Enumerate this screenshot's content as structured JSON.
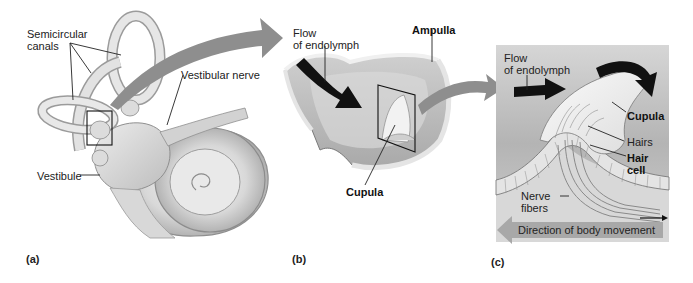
{
  "figure": {
    "panels": [
      {
        "id": "a",
        "letter": "(a)",
        "labels": {
          "semicircular_canals": "Semicircular canals",
          "semicircular_line1": "Semicircular",
          "semicircular_line2": "canals",
          "vestibular_nerve": "Vestibular nerve",
          "vestibule": "Vestibule"
        }
      },
      {
        "id": "b",
        "letter": "(b)",
        "labels": {
          "flow_line1": "Flow",
          "flow_line2": "of endolymph",
          "ampulla": "Ampulla",
          "cupula": "Cupula"
        }
      },
      {
        "id": "c",
        "letter": "(c)",
        "labels": {
          "flow_line1": "Flow",
          "flow_line2": "of endolymph",
          "cupula": "Cupula",
          "hairs": "Hairs",
          "hair_cell_line1": "Hair",
          "hair_cell_line2": "cell",
          "nerve_fibers_line1": "Nerve",
          "nerve_fibers_line2": "fibers",
          "direction": "Direction of body movement"
        }
      }
    ],
    "colors": {
      "background": "#ffffff",
      "tissue_light": "#e6e6e6",
      "tissue_mid": "#c8c8c8",
      "tissue_dark": "#9a9a9a",
      "transition_arrow": "#8a8a8a",
      "flow_arrow": "#111111",
      "panel_c_bg": "#b9b9b9",
      "direction_arrow": "#a9a9a9"
    }
  }
}
